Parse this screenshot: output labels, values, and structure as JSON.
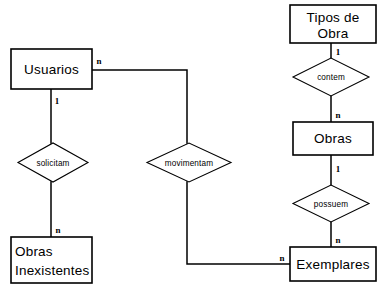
{
  "diagram": {
    "type": "entity-relationship-diagram",
    "background_color": "#ffffff",
    "line_color": "#000000",
    "entities": [
      {
        "id": "usuarios",
        "label": "Usuarios",
        "label_line_1": "Usuarios",
        "label_line_2": ""
      },
      {
        "id": "obras-inexistentes",
        "label": "Obras Inexistentes",
        "label_line_1": "Obras",
        "label_line_2": "Inexistentes"
      },
      {
        "id": "tipos-de-obra",
        "label": "Tipos de Obra",
        "label_line_1": "Tipos  de",
        "label_line_2": "Obra"
      },
      {
        "id": "obras",
        "label": "Obras",
        "label_line_1": "Obras",
        "label_line_2": ""
      },
      {
        "id": "exemplares",
        "label": "Exemplares",
        "label_line_1": "Exemplares",
        "label_line_2": ""
      }
    ],
    "relationships": [
      {
        "id": "solicitam",
        "label": "solicitam",
        "from": "Usuarios",
        "to": "Obras Inexistentes",
        "from_cardinality": "1",
        "to_cardinality": "n"
      },
      {
        "id": "movimentam",
        "label": "movimentam",
        "from": "Usuarios",
        "to": "Exemplares",
        "from_cardinality": "n",
        "to_cardinality": "n"
      },
      {
        "id": "contem",
        "label": "contem",
        "from": "Tipos de Obra",
        "to": "Obras",
        "from_cardinality": "1",
        "to_cardinality": "n"
      },
      {
        "id": "possuem",
        "label": "possuem",
        "from": "Obras",
        "to": "Exemplares",
        "from_cardinality": "1",
        "to_cardinality": "n"
      }
    ],
    "cardinalities": {
      "usuarios_solicitam": "1",
      "solicitam_obras_inexistentes": "n",
      "usuarios_movimentam": "n",
      "movimentam_exemplares": "n",
      "tipos_contem": "1",
      "contem_obras": "n",
      "obras_possuem": "1",
      "possuem_exemplares": "n"
    }
  }
}
